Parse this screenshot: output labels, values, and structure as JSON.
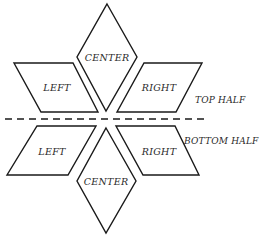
{
  "diagram": {
    "divider": {
      "style": "dashed",
      "label_top": "TOP HALF",
      "label_bottom": "BOTTOM HALF"
    },
    "top_half": {
      "center": {
        "shape": "diamond",
        "label": "CENTER"
      },
      "left": {
        "shape": "parallelogram",
        "label": "LEFT"
      },
      "right": {
        "shape": "parallelogram",
        "label": "RIGHT"
      }
    },
    "bottom_half": {
      "center": {
        "shape": "diamond",
        "label": "CENTER"
      },
      "left": {
        "shape": "parallelogram",
        "label": "LEFT"
      },
      "right": {
        "shape": "parallelogram",
        "label": "RIGHT"
      }
    },
    "colors": {
      "stroke": "#1a1a1a",
      "fill": "#ffffff",
      "text": "#2a2a2a"
    }
  }
}
